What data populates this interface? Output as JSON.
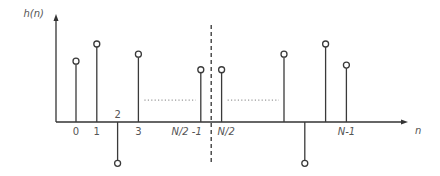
{
  "chart_data": {
    "type": "bar",
    "style": "stem",
    "title": "",
    "ylabel": "h(n)",
    "xlabel": "n",
    "x": [
      0,
      1,
      2,
      3,
      6,
      7,
      10,
      11,
      12,
      13
    ],
    "tick_labels": [
      "0",
      "1",
      "2",
      "3",
      "N/2 -1",
      "N/2",
      "",
      "",
      "",
      "N-1"
    ],
    "values": [
      0.78,
      1.0,
      -0.53,
      0.87,
      0.67,
      0.67,
      0.87,
      -0.53,
      1.0,
      0.73
    ],
    "xlim": [
      -1,
      16
    ],
    "ylim": [
      -0.53,
      1.37
    ],
    "grid": false,
    "legend": "none",
    "omitted_ranges": [
      [
        3,
        6
      ],
      [
        7,
        10
      ]
    ],
    "symmetry_line_x": 6.5
  },
  "colors": {
    "stem": "#3a3a3a",
    "axis": "#333333",
    "ellipsis": "#9a9a9a",
    "text": "#555555"
  }
}
